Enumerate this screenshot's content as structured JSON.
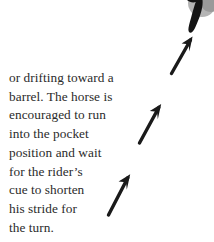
{
  "document": {
    "type": "instructional-book-page-excerpt",
    "background_color": "#ffffff",
    "caption": {
      "text": "or drifting toward a\nbarrel. The horse is\nencouraged to run\ninto the pocket\nposition and wait\nfor the rider’s\ncue to shorten\nhis stride for\nthe turn.",
      "lines": [
        "or drifting toward a",
        "barrel. The horse is",
        "encouraged to run",
        "into the pocket",
        "position and wait",
        "for the rider’s",
        "cue to shorten",
        "his stride for",
        "the turn."
      ],
      "text_color": "#2b2b2b",
      "alignment": "left"
    },
    "annotations": {
      "arrow_color": "#1a1a1a",
      "arrow_label": "hand-drawn-up-right-arrow",
      "arrow_count": 3,
      "arrows": [
        {
          "name": "arrow-top",
          "tail_x": 171,
          "tail_y": 73,
          "head_x": 193,
          "head_y": 37
        },
        {
          "name": "arrow-middle",
          "tail_x": 139,
          "tail_y": 143,
          "head_x": 161,
          "head_y": 105
        },
        {
          "name": "arrow-bottom",
          "tail_x": 108,
          "tail_y": 215,
          "head_x": 130,
          "head_y": 175
        }
      ],
      "photo_fragment": {
        "name": "horse-hoof-fragment",
        "description": "cropped dark tapered hoof shape over two gray circles at top-right corner",
        "dark_color": "#141414",
        "gray_circle_color": "#b4b4b4",
        "gray_circle_shadow": "#9a9a9a"
      }
    }
  }
}
